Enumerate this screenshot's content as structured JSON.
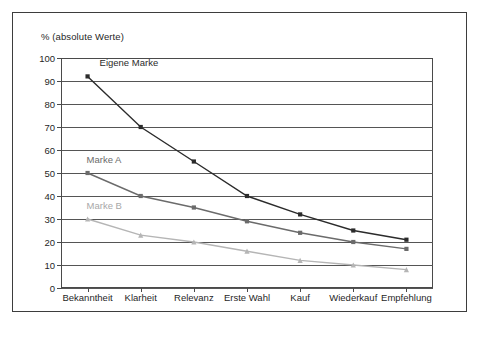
{
  "axis_caption": "% (absolute Werte)",
  "annotations": {
    "eigene_marke": "Eigene Marke",
    "marke_a": "Marke A",
    "marke_b": "Marke B"
  },
  "colors": {
    "eigene_marke": "#2b2b2b",
    "marke_a": "#6b6b6b",
    "marke_b": "#b5b5b5",
    "gridline": "#555555",
    "axis": "#4a4a4a",
    "frame": "#3d3d3d",
    "background": "#ffffff"
  },
  "chart_data": {
    "type": "line",
    "title": "",
    "xlabel": "",
    "ylabel": "% (absolute Werte)",
    "ylim": [
      0,
      100
    ],
    "ytick_step": 10,
    "yticks": [
      100,
      90,
      80,
      70,
      60,
      50,
      40,
      30,
      20,
      10,
      0
    ],
    "grid": true,
    "legend_position": "inline-annotations",
    "categories": [
      "Bekanntheit",
      "Klarheit",
      "Relevanz",
      "Erste Wahl",
      "Kauf",
      "Wiederkauf",
      "Empfehlung"
    ],
    "series": [
      {
        "name": "Eigene Marke",
        "color": "#2b2b2b",
        "marker": "square",
        "values": [
          92,
          70,
          55,
          40,
          32,
          25,
          21
        ]
      },
      {
        "name": "Marke A",
        "color": "#6b6b6b",
        "marker": "square",
        "values": [
          50,
          40,
          35,
          29,
          24,
          20,
          17
        ]
      },
      {
        "name": "Marke B",
        "color": "#b5b5b5",
        "marker": "triangle",
        "values": [
          30,
          23,
          20,
          16,
          12,
          10,
          8
        ]
      }
    ]
  }
}
